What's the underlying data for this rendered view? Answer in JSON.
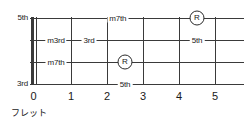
{
  "diagram": {
    "kind": "guitar-fretboard-degree-chart",
    "strings_count": 4,
    "frets": {
      "numbers": [
        "0",
        "1",
        "2",
        "3",
        "4",
        "5"
      ],
      "axis_caption": "フレット"
    },
    "edge_labels": {
      "top": "5th",
      "bottom": "3rd"
    },
    "markers": [
      {
        "id": "s1-m7th",
        "label": "m7th",
        "type": "text",
        "string": 1,
        "fret": 2.3
      },
      {
        "id": "s1-root",
        "label": "R",
        "type": "circle",
        "string": 1,
        "fret": 4.5
      },
      {
        "id": "s2-m3rd",
        "label": "m3rd",
        "type": "text",
        "string": 2,
        "fret": 0.6
      },
      {
        "id": "s2-3rd",
        "label": "3rd",
        "type": "text",
        "string": 2,
        "fret": 1.5
      },
      {
        "id": "s2-5th",
        "label": "5th",
        "type": "text",
        "string": 2,
        "fret": 4.5
      },
      {
        "id": "s3-m7th",
        "label": "m7th",
        "type": "text",
        "string": 3,
        "fret": 0.6
      },
      {
        "id": "s3-root",
        "label": "R",
        "type": "circle",
        "string": 3,
        "fret": 2.5
      },
      {
        "id": "s4-5th",
        "label": "5th",
        "type": "text",
        "string": 4,
        "fret": 2.5
      }
    ],
    "colors": {
      "line": "#3a3a3a",
      "text": "#1a1a1a",
      "background": "#ffffff"
    }
  }
}
